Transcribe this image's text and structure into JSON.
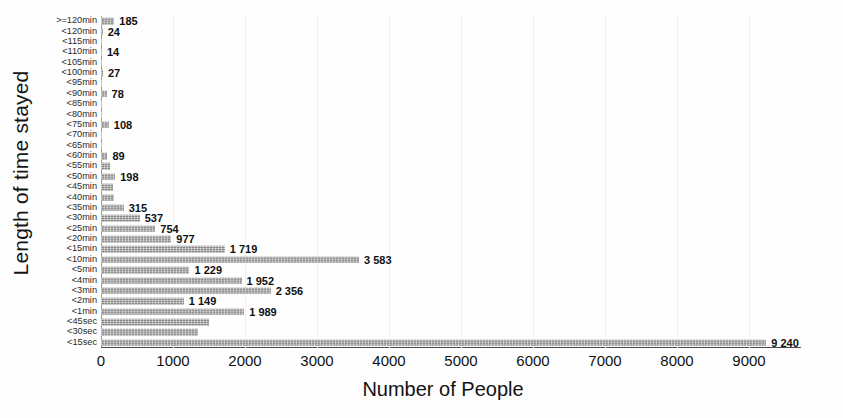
{
  "chart_data": {
    "type": "bar",
    "orientation": "horizontal",
    "title": "",
    "xlabel": "Number of People",
    "ylabel": "Length of time stayed",
    "xlim": [
      0,
      9500
    ],
    "ylim": null,
    "grid": true,
    "legend": false,
    "xticks": [
      "0",
      "1000",
      "2000",
      "3000",
      "4000",
      "5000",
      "6000",
      "7000",
      "8000",
      "9000"
    ],
    "xtick_values": [
      0,
      1000,
      2000,
      3000,
      4000,
      5000,
      6000,
      7000,
      8000,
      9000
    ],
    "categories": [
      ">=120min",
      "<120min",
      "<115min",
      "<110min",
      "<105min",
      "<100min",
      "<95min",
      "<90min",
      "<85min",
      "<80min",
      "<75min",
      "<70min",
      "<65min",
      "<60min",
      "<55min",
      "<50min",
      "<45min",
      "<40min",
      "<35min",
      "<30min",
      "<25min",
      "<20min",
      "<15min",
      "<10min",
      "<5min",
      "<4min",
      "<3min",
      "<2min",
      "<1min",
      "<45sec",
      "<30sec",
      "<15sec"
    ],
    "values": [
      185,
      24,
      9,
      14,
      8,
      27,
      6,
      78,
      7,
      9,
      108,
      8,
      10,
      89,
      120,
      198,
      160,
      175,
      315,
      537,
      754,
      977,
      1719,
      3583,
      1229,
      1952,
      2356,
      1149,
      1989,
      1500,
      1350,
      9240
    ],
    "value_labels": [
      "185",
      "24",
      "",
      "14",
      "",
      "27",
      "",
      "78",
      "",
      "",
      "108",
      "",
      "",
      "89",
      "",
      "198",
      "",
      "",
      "315",
      "537",
      "754",
      "977",
      "1 719",
      "3 583",
      "1 229",
      "1 952",
      "2 356",
      "1 149",
      "1 989",
      "",
      "",
      "9 240"
    ],
    "series": [
      {
        "name": "Number of People",
        "color": "#9e9e9e",
        "values": [
          185,
          24,
          9,
          14,
          8,
          27,
          6,
          78,
          7,
          9,
          108,
          8,
          10,
          89,
          120,
          198,
          160,
          175,
          315,
          537,
          754,
          977,
          1719,
          3583,
          1229,
          1952,
          2356,
          1149,
          1989,
          1500,
          1350,
          9240
        ]
      }
    ]
  },
  "axes": {
    "x_title": "Number of People",
    "y_title": "Length of time stayed"
  },
  "colors": {
    "bar": "#9e9e9e",
    "axis": "#4a4a4a",
    "grid": "#f1f1f1",
    "text": "#121212"
  }
}
